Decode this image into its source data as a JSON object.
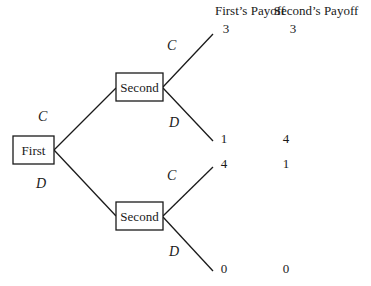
{
  "headers": {
    "first_payoff": "First’s Payoff",
    "second_payoff": "Second’s Payoff"
  },
  "nodes": {
    "root": "First",
    "upper": "Second",
    "lower": "Second"
  },
  "edges": {
    "root_upper": "C",
    "root_lower": "D",
    "upper_top": "C",
    "upper_bottom": "D",
    "lower_top": "C",
    "lower_bottom": "D"
  },
  "outcomes": [
    {
      "first": "3",
      "second": "3"
    },
    {
      "first": "1",
      "second": "4"
    },
    {
      "first": "4",
      "second": "1"
    },
    {
      "first": "0",
      "second": "0"
    }
  ]
}
